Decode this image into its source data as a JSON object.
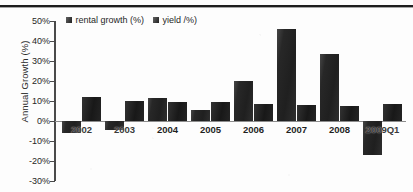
{
  "chart_data": {
    "type": "bar",
    "title": "",
    "xlabel": "",
    "ylabel": "Annual Growth (%)",
    "categories": [
      "2002",
      "2003",
      "2004",
      "2005",
      "2006",
      "2007",
      "2008",
      "2009Q1"
    ],
    "series": [
      {
        "name": "rental growth (%)",
        "values": [
          -6,
          -4.5,
          11.5,
          5.5,
          20,
          46,
          33.5,
          -17
        ]
      },
      {
        "name": "yield /%)",
        "values": [
          12,
          10,
          9.5,
          9.5,
          8.5,
          8,
          7.5,
          8.5
        ]
      }
    ],
    "ylim": [
      -30,
      50
    ],
    "ytick_step": 10,
    "ytick_labels": [
      "50%",
      "40%",
      "30%",
      "20%",
      "10%",
      "0%",
      "-10%",
      "-20%",
      "-30%"
    ],
    "ytick_values": [
      50,
      40,
      30,
      20,
      10,
      0,
      -10,
      -20,
      -30
    ],
    "grid": false,
    "legend_position": "top-center",
    "zero_line": true,
    "series_colors": [
      "#232323",
      "#1b1b1b"
    ]
  },
  "legend": {
    "entries": [
      {
        "label": "rental growth (%)",
        "swatch": "legend-swatch-rental-growth"
      },
      {
        "label": "yield /%)",
        "swatch": "legend-swatch-yield"
      }
    ]
  }
}
